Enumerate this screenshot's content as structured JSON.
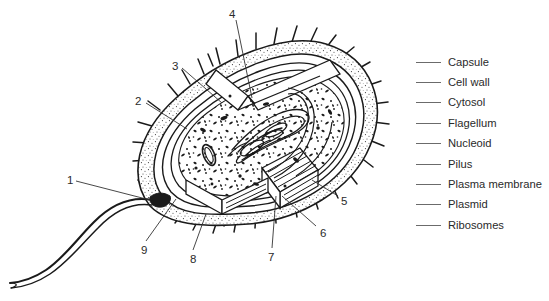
{
  "figure": {
    "background_color": "#ffffff",
    "ink_color": "#1a1a1a",
    "legend_rule_color": "#6b6b6b"
  },
  "legend": {
    "items": [
      {
        "number": "",
        "label": "Capsule"
      },
      {
        "number": "",
        "label": "Cell wall"
      },
      {
        "number": "",
        "label": "Cytosol"
      },
      {
        "number": "",
        "label": "Flagellum"
      },
      {
        "number": "",
        "label": "Nucleoid"
      },
      {
        "number": "",
        "label": "Pilus"
      },
      {
        "number": "",
        "label": "Plasma membrane"
      },
      {
        "number": "",
        "label": "Plasmid"
      },
      {
        "number": "",
        "label": "Ribosomes"
      }
    ]
  },
  "callouts": [
    {
      "id": "callout-1",
      "label": "1",
      "x": 67,
      "y": 175
    },
    {
      "id": "callout-2",
      "label": "2",
      "x": 135,
      "y": 96
    },
    {
      "id": "callout-3",
      "label": "3",
      "x": 172,
      "y": 61
    },
    {
      "id": "callout-4",
      "label": "4",
      "x": 229,
      "y": 9
    },
    {
      "id": "callout-5",
      "label": "5",
      "x": 341,
      "y": 196
    },
    {
      "id": "callout-6",
      "label": "6",
      "x": 320,
      "y": 228
    },
    {
      "id": "callout-7",
      "label": "7",
      "x": 268,
      "y": 252
    },
    {
      "id": "callout-8",
      "label": "8",
      "x": 190,
      "y": 254
    },
    {
      "id": "callout-9",
      "label": "9",
      "x": 141,
      "y": 245
    }
  ]
}
